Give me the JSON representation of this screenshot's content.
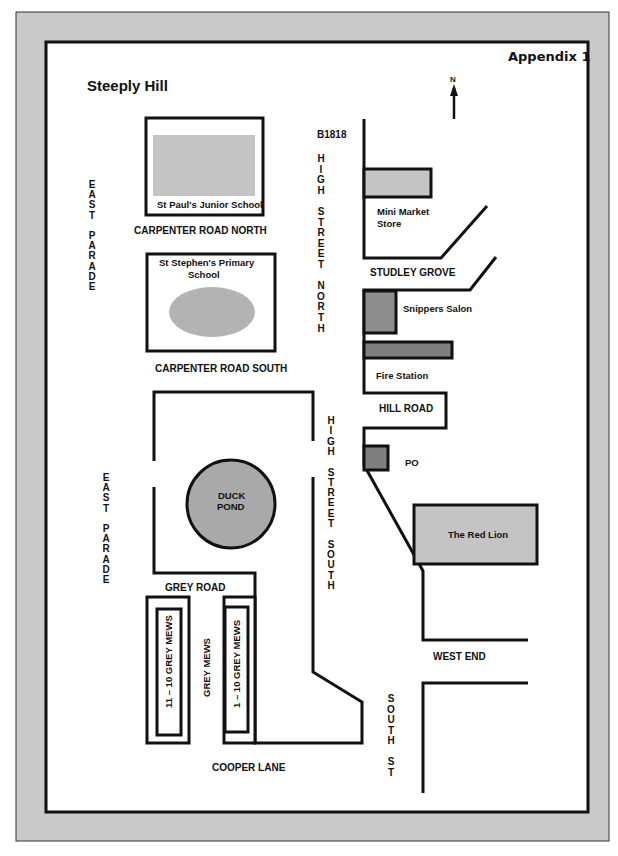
{
  "header": {
    "appendix": "Appendix 1",
    "title": "Steeply Hill",
    "north_label": "N",
    "north_icon": "north-arrow-icon"
  },
  "colors": {
    "frame": "#c8c8c8",
    "building_light": "#c4c4c4",
    "building_dark": "#8e8e8e",
    "pond": "#a9a9a9",
    "line": "#111111"
  },
  "roads": {
    "road_number": "B1818",
    "high_street_north": [
      "H",
      "I",
      "G",
      "H",
      "",
      "S",
      "T",
      "R",
      "E",
      "E",
      "T",
      "",
      "N",
      "O",
      "R",
      "T",
      "H"
    ],
    "high_street_south": [
      "H",
      "I",
      "G",
      "H",
      "",
      "S",
      "T",
      "R",
      "E",
      "E",
      "T",
      "",
      "S",
      "O",
      "U",
      "T",
      "H"
    ],
    "east_parade_north": [
      "E",
      "A",
      "S",
      "T",
      "",
      "P",
      "A",
      "R",
      "A",
      "D",
      "E"
    ],
    "east_parade_south": [
      "E",
      "A",
      "S",
      "T",
      "",
      "P",
      "A",
      "R",
      "A",
      "D",
      "E"
    ],
    "south_st": [
      "S",
      "O",
      "U",
      "T",
      "H",
      "",
      "S",
      "T"
    ],
    "carpenter_road_north": "CARPENTER ROAD NORTH",
    "carpenter_road_south": "CARPENTER ROAD SOUTH",
    "studley_grove": "STUDLEY GROVE",
    "hill_road": "HILL ROAD",
    "grey_road": "GREY ROAD",
    "grey_mews": "GREY MEWS",
    "cooper_lane": "COOPER LANE",
    "west_end": "WEST END"
  },
  "places": {
    "st_pauls": "St Paul's Junior School",
    "st_stephens_line1": "St Stephen's Primary",
    "st_stephens_line2": "School",
    "mini_market_line1": "Mini Market",
    "mini_market_line2": "Store",
    "snippers": "Snippers Salon",
    "fire_station": "Fire Station",
    "po": "PO",
    "red_lion": "The Red Lion",
    "duck_pond_line1": "DUCK",
    "duck_pond_line2": "POND",
    "mews_11_10": "11 – 10  GREY MEWS",
    "mews_1_10": "1 – 10  GREY MEWS"
  }
}
